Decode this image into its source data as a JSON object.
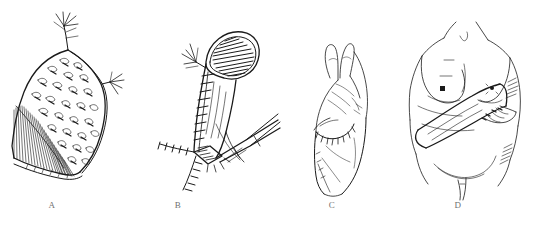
{
  "figure": {
    "background_color": "#ffffff",
    "ink_color": "#1a1a1a",
    "label_color": "#6f6f6f",
    "width": 536,
    "height": 232,
    "panel_count": 4
  },
  "panels": [
    {
      "id": "panel-a",
      "label": "A",
      "label_x": 52,
      "label_y": 206,
      "caption": "Raised skin flap with stippled surface texture, vascular pedicles at upper and right margins, and dense hatching along the undersurface",
      "icon": "skin-flap-illustration"
    },
    {
      "id": "panel-b",
      "label": "B",
      "label_x": 178,
      "label_y": 206,
      "caption": "Tubed flap with hatched open end, running sutures along the closure, and surgical forceps at the donor-site defect",
      "icon": "tubed-flap-illustration"
    },
    {
      "id": "panel-c",
      "label": "C",
      "label_x": 332,
      "label_y": 206,
      "caption": "Hand and forearm with the tube flap inset and sutured to the distal forearm",
      "icon": "hand-forearm-illustration"
    },
    {
      "id": "panel-d",
      "label": "D",
      "label_x": 458,
      "label_y": 206,
      "caption": "Female torso with the flap-carrying forearm positioned across the abdomen",
      "icon": "torso-carrier-illustration"
    }
  ]
}
